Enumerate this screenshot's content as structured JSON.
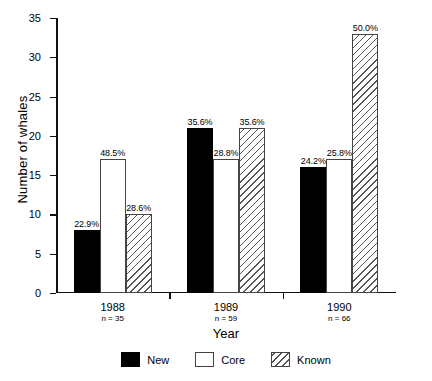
{
  "chart_data": {
    "type": "bar",
    "title": "",
    "subtitle": "",
    "xlabel": "Year",
    "ylabel": "Number of whales",
    "categories": [
      "1988",
      "1989",
      "1990"
    ],
    "category_sublabels": [
      "n = 35",
      "n = 59",
      "n = 66"
    ],
    "sample_sizes": [
      35,
      59,
      66
    ],
    "ylim": [
      0,
      35
    ],
    "yticks": [
      0,
      5,
      10,
      15,
      20,
      25,
      30,
      35
    ],
    "ytick_labels": [
      "0",
      "5",
      "10",
      "15",
      "20",
      "25",
      "30",
      "35"
    ],
    "grid": false,
    "legend_position": "bottom",
    "series": [
      {
        "name": "New",
        "fill": "solid-black",
        "color": "#000000",
        "values": [
          8,
          21,
          16
        ],
        "data_labels": [
          "22.9%",
          "35.6%",
          "24.2%"
        ]
      },
      {
        "name": "Core",
        "fill": "white",
        "color": "#ffffff",
        "values": [
          17,
          17,
          17
        ],
        "data_labels": [
          "48.5%",
          "28.8%",
          "25.8%"
        ]
      },
      {
        "name": "Known",
        "fill": "diagonal-hatch",
        "color": "#555555",
        "values": [
          10,
          21,
          33
        ],
        "data_labels": [
          "28.6%",
          "35.6%",
          "50.0%"
        ]
      }
    ]
  },
  "legend": {
    "items": [
      {
        "label": "New",
        "swatch": "solid-black-swatch"
      },
      {
        "label": "Core",
        "swatch": "white-swatch"
      },
      {
        "label": "Known",
        "swatch": "hatched-swatch"
      }
    ]
  }
}
